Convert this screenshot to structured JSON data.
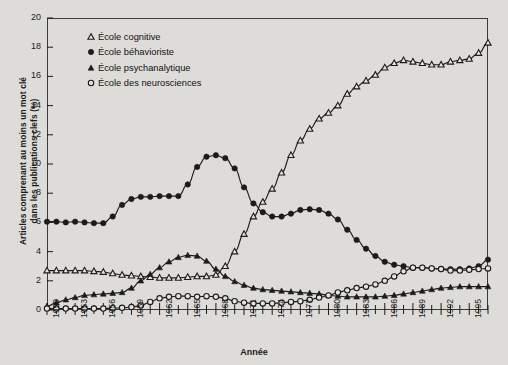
{
  "chart_data": {
    "type": "line",
    "title": "",
    "xlabel": "Année",
    "ylabel_line1": "Articles comprenant au moins un mot clé",
    "ylabel_line2": "dans les publications clefs (%)",
    "xlim": [
      1950,
      1997
    ],
    "ylim": [
      0,
      20
    ],
    "ytick_step": 2,
    "yticks": [
      0,
      2,
      4,
      6,
      8,
      10,
      12,
      14,
      16,
      18,
      20
    ],
    "xticks_labeled": [
      1950,
      1953,
      1956,
      1959,
      1962,
      1965,
      1968,
      1971,
      1974,
      1977,
      1980,
      1983,
      1986,
      1989,
      1992,
      1995
    ],
    "xtick_minor_step": 1,
    "grid": false,
    "legend_position": "top-left",
    "x": [
      1950,
      1951,
      1952,
      1953,
      1954,
      1955,
      1956,
      1957,
      1958,
      1959,
      1960,
      1961,
      1962,
      1963,
      1964,
      1965,
      1966,
      1967,
      1968,
      1969,
      1970,
      1971,
      1972,
      1973,
      1974,
      1975,
      1976,
      1977,
      1978,
      1979,
      1980,
      1981,
      1982,
      1983,
      1984,
      1985,
      1986,
      1987,
      1988,
      1989,
      1990,
      1991,
      1992,
      1993,
      1994,
      1995,
      1996,
      1997
    ],
    "series": [
      {
        "name": "École cognitive",
        "marker": "open-triangle",
        "values": [
          2.7,
          2.7,
          2.7,
          2.7,
          2.7,
          2.65,
          2.6,
          2.5,
          2.4,
          2.35,
          2.3,
          2.25,
          2.2,
          2.2,
          2.2,
          2.25,
          2.3,
          2.3,
          2.4,
          3.0,
          4.0,
          5.2,
          6.4,
          7.4,
          8.3,
          9.4,
          10.6,
          11.6,
          12.4,
          13.1,
          13.5,
          14.0,
          14.8,
          15.3,
          15.7,
          16.1,
          16.6,
          16.9,
          17.1,
          17.0,
          16.9,
          16.8,
          16.8,
          17.0,
          17.1,
          17.2,
          17.6,
          18.3
        ]
      },
      {
        "name": "École béhavioriste",
        "marker": "filled-circle",
        "values": [
          6.05,
          6.05,
          6.0,
          6.05,
          6.0,
          5.95,
          5.95,
          6.4,
          7.2,
          7.6,
          7.75,
          7.75,
          7.8,
          7.8,
          7.8,
          8.6,
          9.8,
          10.5,
          10.6,
          10.4,
          9.7,
          8.4,
          7.3,
          6.7,
          6.4,
          6.4,
          6.6,
          6.85,
          6.9,
          6.85,
          6.6,
          6.2,
          5.5,
          4.8,
          4.2,
          3.7,
          3.3,
          3.1,
          3.0,
          2.9,
          2.9,
          2.85,
          2.8,
          2.8,
          2.8,
          2.85,
          3.0,
          3.45
        ]
      },
      {
        "name": "École psychanalytique",
        "marker": "filled-triangle",
        "values": [
          0.25,
          0.5,
          0.7,
          0.85,
          1.0,
          1.05,
          1.1,
          1.15,
          1.2,
          1.5,
          2.0,
          2.45,
          2.9,
          3.3,
          3.6,
          3.75,
          3.7,
          3.35,
          2.8,
          2.3,
          1.95,
          1.7,
          1.5,
          1.4,
          1.35,
          1.3,
          1.25,
          1.2,
          1.15,
          1.1,
          1.0,
          0.95,
          0.9,
          0.9,
          0.9,
          0.9,
          0.95,
          1.0,
          1.1,
          1.2,
          1.3,
          1.4,
          1.5,
          1.55,
          1.6,
          1.6,
          1.6,
          1.6
        ]
      },
      {
        "name": "École des neurosciences",
        "marker": "open-circle",
        "values": [
          0.1,
          0.1,
          0.1,
          0.1,
          0.1,
          0.1,
          0.1,
          0.12,
          0.15,
          0.2,
          0.3,
          0.55,
          0.8,
          0.9,
          0.95,
          0.95,
          0.9,
          0.95,
          0.9,
          0.8,
          0.6,
          0.5,
          0.45,
          0.45,
          0.45,
          0.5,
          0.55,
          0.6,
          0.7,
          0.85,
          1.0,
          1.2,
          1.35,
          1.5,
          1.6,
          1.75,
          2.0,
          2.3,
          2.65,
          2.9,
          2.9,
          2.85,
          2.8,
          2.7,
          2.7,
          2.75,
          2.8,
          2.85
        ]
      }
    ]
  },
  "legend": {
    "items": [
      {
        "label": "École cognitive",
        "marker": "open-triangle"
      },
      {
        "label": "École béhavioriste",
        "marker": "filled-circle"
      },
      {
        "label": "École psychanalytique",
        "marker": "filled-triangle"
      },
      {
        "label": "École des neurosciences",
        "marker": "open-circle"
      }
    ]
  },
  "colors": {
    "background": "#dedcd8",
    "line": "#1b1b1b",
    "frame": "#3a3a3a",
    "text": "#1a1a1a"
  }
}
